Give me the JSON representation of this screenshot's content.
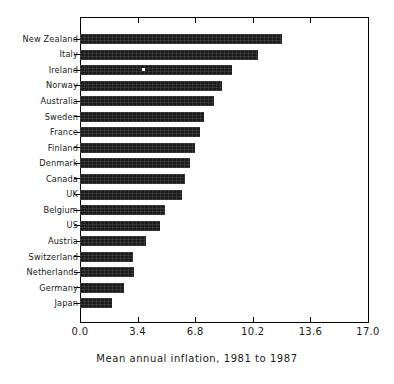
{
  "chart_data": {
    "type": "bar",
    "orientation": "horizontal",
    "title": "",
    "xlabel": "Mean annual inflation, 1981 to 1987",
    "ylabel": "",
    "xlim": [
      0.0,
      17.0
    ],
    "xticks": [
      "0.0",
      "3.4",
      "6.8",
      "10.2",
      "13.6",
      "17.0"
    ],
    "xtick_values": [
      0.0,
      3.4,
      6.8,
      10.2,
      13.6,
      17.0
    ],
    "grid": false,
    "legend": null,
    "categories": [
      "New Zealand",
      "Italy",
      "Ireland",
      "Norway",
      "Australia",
      "Sweden",
      "France",
      "Finland",
      "Denmark",
      "Canada",
      "UK",
      "Belgium",
      "US",
      "Austria",
      "Switzerland",
      "Netherlands",
      "Germany",
      "Japan"
    ],
    "values": [
      11.9,
      10.5,
      9.0,
      8.4,
      7.9,
      7.3,
      7.1,
      6.8,
      6.5,
      6.2,
      6.0,
      5.0,
      4.7,
      3.9,
      3.1,
      3.2,
      2.6,
      1.9
    ],
    "bar_color": "#1b1b1b",
    "axis_color": "#000000",
    "background_color": "#ffffff"
  }
}
